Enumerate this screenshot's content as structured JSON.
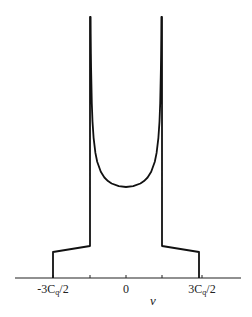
{
  "chart_data": {
    "type": "line",
    "title": "",
    "xlabel": "ν",
    "ylabel": "",
    "grid": false,
    "legend": null,
    "x_ticks": [
      {
        "value": -1.5,
        "label": "-3Cq/2"
      },
      {
        "value": -0.75,
        "label": ""
      },
      {
        "value": 0,
        "label": "0"
      },
      {
        "value": 0.75,
        "label": ""
      },
      {
        "value": 1.5,
        "label": "3Cq/2"
      }
    ],
    "x_range": [
      -2.0,
      2.0
    ],
    "x_unit": "Cq",
    "series": [
      {
        "name": "spectrum",
        "points_x_in_3Cq_over_2_units": [
          -1.0,
          -1.0,
          -0.5,
          -0.5,
          -0.492,
          -0.49,
          -0.485,
          -0.475,
          -0.465,
          -0.45,
          -0.425,
          -0.4,
          -0.35,
          -0.3,
          -0.25,
          -0.2,
          -0.1,
          0.0,
          0.1,
          0.2,
          0.25,
          0.3,
          0.35,
          0.4,
          0.425,
          0.45,
          0.465,
          0.475,
          0.485,
          0.49,
          0.492,
          0.5,
          0.5,
          1.0,
          1.0
        ],
        "relative_intensity": [
          0.0,
          0.1,
          0.12,
          1.0,
          1.0,
          0.93,
          0.8,
          0.61,
          0.56,
          0.5,
          0.43,
          0.38,
          0.34,
          0.32,
          0.3,
          0.29,
          0.28,
          0.27,
          0.28,
          0.29,
          0.3,
          0.32,
          0.34,
          0.38,
          0.43,
          0.5,
          0.56,
          0.61,
          0.8,
          0.93,
          1.0,
          1.0,
          0.12,
          0.1,
          0.0
        ]
      }
    ],
    "pixel_geometry": {
      "axis_y": 278,
      "axis_x_start": 15,
      "axis_x_end": 241,
      "center_x": 126,
      "inner_half_width": 36,
      "outer_half_width": 73,
      "top_clip_y": 17,
      "u_min_y": 187,
      "u_scale": 38,
      "outer_step_y": 252,
      "inner_step_y": 246,
      "tick_xs": [
        53,
        90,
        126,
        162,
        202
      ],
      "tick_len": 3,
      "u_samples": [
        0,
        0.2,
        0.4,
        0.5,
        0.6,
        0.7,
        0.8,
        0.85,
        0.9,
        0.93,
        0.95,
        0.97,
        0.975,
        0.98,
        0.984
      ]
    }
  },
  "labels": {
    "tick_neg": "-3C",
    "tick_neg_sub": "q",
    "tick_neg_tail": "/2",
    "tick_zero": "0",
    "tick_pos": "3C",
    "tick_pos_sub": "q",
    "tick_pos_tail": "/2",
    "x_axis_label": "ν"
  }
}
